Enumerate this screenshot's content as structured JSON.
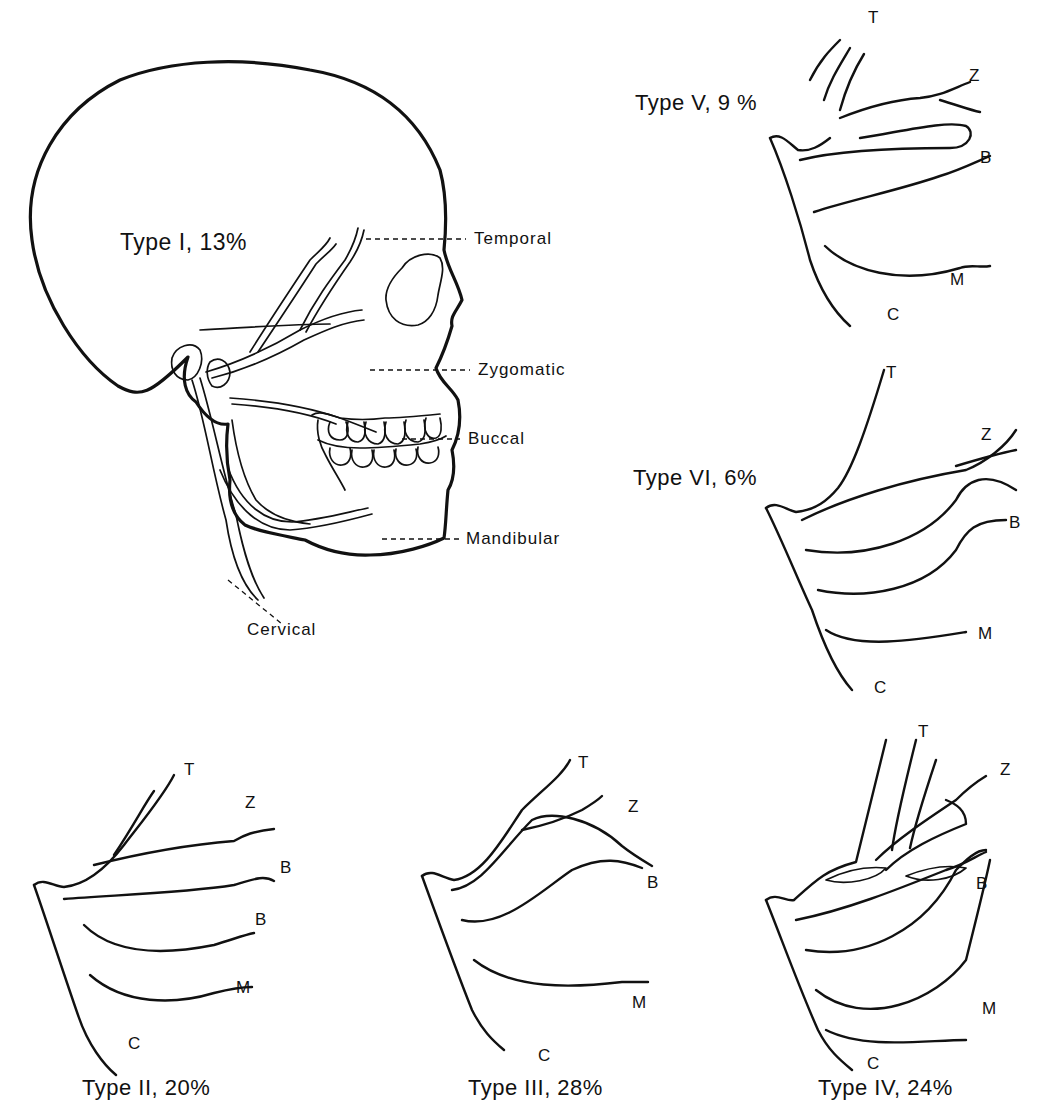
{
  "figure": {
    "main": {
      "title": "Type I, 13%",
      "branches": {
        "temporal": "Temporal",
        "zygomatic": "Zygomatic",
        "buccal": "Buccal",
        "mandibular": "Mandibular",
        "cervical": "Cervical"
      }
    },
    "types": [
      {
        "id": "II",
        "title": "Type II, 20%",
        "percent": 20,
        "letters": [
          "T",
          "Z",
          "B",
          "B",
          "M",
          "C"
        ]
      },
      {
        "id": "III",
        "title": "Type III, 28%",
        "percent": 28,
        "letters": [
          "T",
          "Z",
          "B",
          "M",
          "C"
        ]
      },
      {
        "id": "IV",
        "title": "Type IV, 24%",
        "percent": 24,
        "letters": [
          "T",
          "Z",
          "B",
          "M",
          "C"
        ]
      },
      {
        "id": "V",
        "title": "Type V, 9 %",
        "percent": 9,
        "letters": [
          "T",
          "Z",
          "B",
          "M",
          "C"
        ]
      },
      {
        "id": "VI",
        "title": "Type VI, 6%",
        "percent": 6,
        "letters": [
          "T",
          "Z",
          "B",
          "M",
          "C"
        ]
      }
    ],
    "type_i_percent": 13
  }
}
